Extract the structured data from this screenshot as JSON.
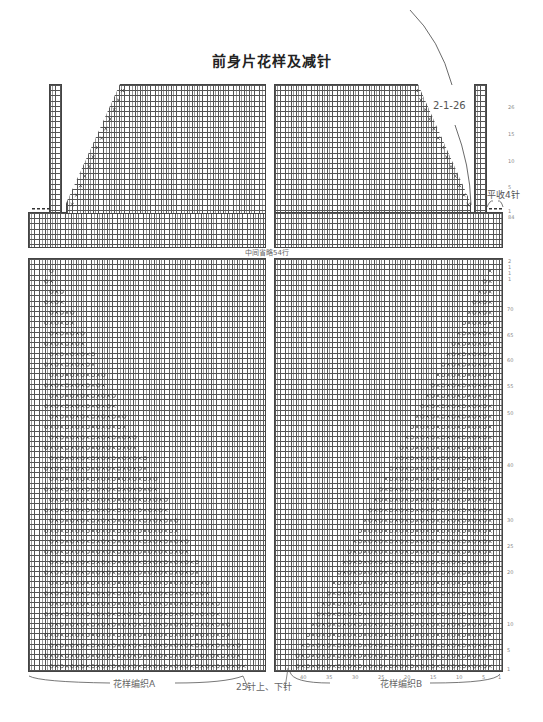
{
  "title": "前身片花样及减针",
  "annotations": {
    "decrease_rule": "2-1-26",
    "flat_bind": "平收4针",
    "center_rows": "中间省略54行",
    "pattern_a": "花样编织A",
    "pattern_b": "花样编织B",
    "rib_note": "25针上、下针"
  },
  "upper_row_numbers": [
    "26",
    "15",
    "10",
    "5",
    "1",
    "84"
  ],
  "lower_row_numbers": [
    "70",
    "65",
    "60",
    "55",
    "50",
    "40",
    "30",
    "25",
    "20",
    "10",
    "5",
    "1"
  ],
  "lower_row_top_marks": [
    "2",
    "1",
    "1",
    "1"
  ],
  "column_numbers": [
    "40",
    "35",
    "30",
    "25",
    "20",
    "15",
    "10",
    "5",
    "1"
  ],
  "symbols": {
    "knit": "|",
    "yarn_over": "○",
    "decrease": "×",
    "bind_off": "•"
  },
  "colors": {
    "grid_line": "#555555",
    "background": "#ffffff",
    "text": "#333333"
  }
}
